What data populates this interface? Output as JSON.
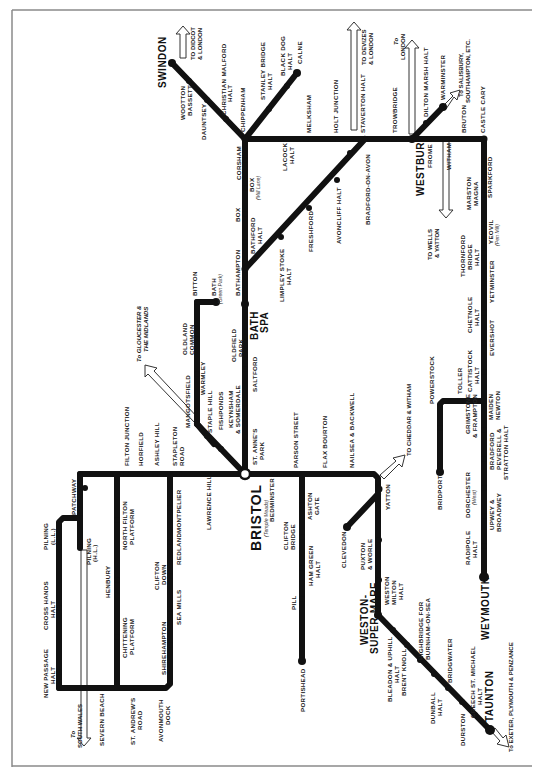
{
  "colors": {
    "line": "#111111",
    "background": "#ffffff",
    "frame": "#8a8a8a",
    "text": "#222222"
  },
  "major_stations": {
    "swindon": "SWINDON",
    "bristol": "BRISTOL",
    "bristol_sub": "(Temple Meads)",
    "westbury": "WESTBURY",
    "bath_1": "BATH",
    "bath_2": "SPA",
    "weston_1": "WESTON-",
    "weston_2": "SUPER-MARE",
    "taunton": "TAUNTON",
    "weymouth": "WEYMOUTH"
  },
  "directions": {
    "didcot_1": "TO DIDCOT",
    "didcot_2": "& LONDON",
    "devizes_1": "TO DEVIZES",
    "devizes_2": "& LONDON",
    "london_1": "To",
    "london_2": "LONDON",
    "salisbury_1": "To SALISBURY,",
    "salisbury_2": "SOUTHAMPTON, ETC.",
    "gloucester_1": "To GLOUCESTER &",
    "gloucester_2": "THE MIDLANDS",
    "wells_1": "TO WELLS",
    "wells_2": "& YATTON",
    "cheddar": "TO CHEDDAR & WITHAM",
    "south_wales_1": "To",
    "south_wales_2": "SOUTH WALES",
    "exeter": "To EXETER, PLYMOUTH & PENZANCE"
  },
  "stations": {
    "wootton_bassett": [
      "WOOTTON",
      "BASSETT"
    ],
    "dauntsey": [
      "DAUNTSEY"
    ],
    "christian_malford": [
      "CHRISTIAN MALFORD",
      "HALT"
    ],
    "chippenham": [
      "CHIPPENHAM"
    ],
    "stanley_bridge": [
      "STANLEY BRIDGE",
      "HALT"
    ],
    "black_dog": [
      "BLACK DOG",
      "HALT"
    ],
    "calne": [
      "CALNE"
    ],
    "melksham": [
      "MELKSHAM"
    ],
    "holt_junction": [
      "HOLT JUNCTION"
    ],
    "staverton": [
      "STAVERTON HALT"
    ],
    "trowbridge": [
      "TROWBRIDGE"
    ],
    "dilton_marsh": [
      "DILTON MARSH HALT"
    ],
    "warminster": [
      "WARMINSTER"
    ],
    "frome": [
      "FROME"
    ],
    "witham": [
      "WITHAM"
    ],
    "bruton": [
      "BRUTON"
    ],
    "castle_cary": [
      "CASTLE CARY"
    ],
    "lacock": [
      "LACOCK",
      "HALT"
    ],
    "corsham": [
      "CORSHAM"
    ],
    "box_mill_lane": [
      "BOX",
      "(Mill Lane)"
    ],
    "box": [
      "BOX"
    ],
    "bathford": [
      "BATHFORD",
      "HALT"
    ],
    "bathampton": [
      "BATHAMPTON"
    ],
    "limpley_stoke": [
      "LIMPLEY STOKE",
      "HALT"
    ],
    "freshford": [
      "FRESHFORD"
    ],
    "avoncliff": [
      "AVONCLIFF HALT"
    ],
    "bradford_on_avon": [
      "BRADFORD-ON-AVON"
    ],
    "sparkford": [
      "SPARKFORD"
    ],
    "marston_magna": [
      "MARSTON",
      "MAGNA"
    ],
    "yeovil": [
      "YEOVIL",
      "(Pen Mill)"
    ],
    "thornford": [
      "THORNFORD",
      "BRIDGE",
      "HALT"
    ],
    "yetminster": [
      "YETMINSTER"
    ],
    "chetnole": [
      "CHETNOLE",
      "HALT"
    ],
    "evershot": [
      "EVERSHOT"
    ],
    "cattistock": [
      "CATTISTOCK",
      "HALT"
    ],
    "maiden_newton": [
      "MAIDEN",
      "NEWTON"
    ],
    "toller": [
      "TOLLER"
    ],
    "powerstock": [
      "POWERSTOCK"
    ],
    "bridport": [
      "BRIDPORT"
    ],
    "grimstone": [
      "GRIMSTONE",
      "& FRAMPTON"
    ],
    "bradford_peverell": [
      "BRADFORD",
      "PEVERELL &",
      "STRATTON HALT"
    ],
    "dorchester": [
      "DORCHESTER",
      "(West)"
    ],
    "upwey": [
      "UPWEY &",
      "BROADWEY"
    ],
    "radipole": [
      "RADIPOLE",
      "HALT"
    ],
    "bitton": [
      "BITTON"
    ],
    "bath_green_park": [
      "BATH",
      "(Green Park)"
    ],
    "oldland_common": [
      "OLDLAND",
      "COMMON"
    ],
    "warmley": [
      "WARMLEY"
    ],
    "mangotsfield": [
      "MANGOTSFIELD"
    ],
    "staple_hill": [
      "STAPLE HILL"
    ],
    "fishponds": [
      "FISHPONDS"
    ],
    "oldfield_park": [
      "OLDFIELD",
      "PARK"
    ],
    "saltford": [
      "SALTFORD"
    ],
    "keynsham": [
      "KEYNSHAM",
      "& SOMERDALE"
    ],
    "st_annes_park": [
      "ST. ANNE'S",
      "PARK"
    ],
    "parson_street": [
      "PARSON STREET"
    ],
    "flax_bourton": [
      "FLAX BOURTON"
    ],
    "nailsea": [
      "NAILSEA & BACKWELL"
    ],
    "yatton": [
      "YATTON"
    ],
    "bedminster": [
      "BEDMINSTER"
    ],
    "ashton_gate": [
      "ASHTON",
      "GATE"
    ],
    "clifton_bridge": [
      "CLIFTON",
      "BRIDGE"
    ],
    "ham_green": [
      "HAM GREEN",
      "HALT"
    ],
    "pill": [
      "PILL"
    ],
    "portishead": [
      "PORTISHEAD"
    ],
    "clevedon": [
      "CLEVEDON"
    ],
    "puxton": [
      "PUXTON",
      "& WORLE"
    ],
    "weston_milton": [
      "WESTON",
      "MILTON",
      "HALT"
    ],
    "bleadon": [
      "BLEADON & UPHILL",
      "HALT"
    ],
    "brent_knoll": [
      "BRENT KNOLL"
    ],
    "highbridge": [
      "HIGHBRIDGE FOR",
      "BURNHAM-ON-SEA"
    ],
    "dunball": [
      "DUNBALL",
      "HALT"
    ],
    "bridgwater": [
      "BRIDGWATER"
    ],
    "durston": [
      "DURSTON"
    ],
    "creech": [
      "CREECH ST. MICHAEL",
      "HALT"
    ],
    "lawrence_hill": [
      "LAWRENCE HILL"
    ],
    "stapleton_road": [
      "STAPLETON",
      "ROAD"
    ],
    "ashley_hill": [
      "ASHLEY HILL"
    ],
    "horfield": [
      "HORFIELD"
    ],
    "filton_junction": [
      "FILTON JUNCTION"
    ],
    "patchway": [
      "PATCHWAY"
    ],
    "north_filton": [
      "NORTH FILTON",
      "PLATFORM"
    ],
    "henbury": [
      "HENBURY"
    ],
    "chittening": [
      "CHITTENING",
      "PLATFORM"
    ],
    "montpelier": [
      "MONTPELIER"
    ],
    "redland": [
      "REDLAND"
    ],
    "clifton_down": [
      "CLIFTON",
      "DOWN"
    ],
    "sea_mills": [
      "SEA MILLS"
    ],
    "shirehampton": [
      "SHIREHAMPTON"
    ],
    "avonmouth": [
      "AVONMOUTH",
      "DOCK"
    ],
    "st_andrews_road": [
      "ST. ANDREW'S",
      "ROAD"
    ],
    "severn_beach": [
      "SEVERN BEACH"
    ],
    "pilning_hl": [
      "PILNING",
      "(H.L.)"
    ],
    "pilning_ll": [
      "PILNING",
      "(L.L.)"
    ],
    "cross_hands": [
      "CROSS HANDS",
      "HALT"
    ],
    "new_passage": [
      "NEW PASSAGE",
      "HALT"
    ]
  }
}
